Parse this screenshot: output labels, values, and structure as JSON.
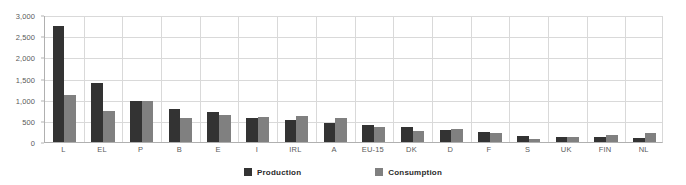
{
  "chart_data": {
    "type": "bar",
    "title": "",
    "subtitle": "",
    "xlabel": "",
    "ylabel": "",
    "ylim": [
      0,
      3000
    ],
    "ytick_values": [
      0,
      500,
      1000,
      1500,
      2000,
      2500,
      3000
    ],
    "ytick_labels": [
      "0",
      "500",
      "1,000",
      "1,500",
      "2,000",
      "2,500",
      "3,000"
    ],
    "grid": true,
    "legend_position": "bottom-center",
    "categories": [
      "L",
      "EL",
      "P",
      "B",
      "E",
      "I",
      "IRL",
      "A",
      "EU-15",
      "DK",
      "D",
      "F",
      "S",
      "UK",
      "FIN",
      "NL"
    ],
    "series": [
      {
        "name": "Production",
        "color": "#333333",
        "values": [
          2750,
          1400,
          960,
          770,
          700,
          570,
          530,
          440,
          400,
          350,
          290,
          230,
          140,
          110,
          120,
          90
        ]
      },
      {
        "name": "Consumption",
        "color": "#808080",
        "values": [
          1120,
          730,
          960,
          570,
          640,
          580,
          610,
          570,
          360,
          250,
          310,
          210,
          70,
          130,
          160,
          210
        ]
      }
    ]
  },
  "colors": {
    "production": "#333333",
    "consumption": "#808080",
    "gridline": "#d9d9d9",
    "axis": "#b0b0b0",
    "tick_text": "#5a5a5a",
    "legend_text": "#2b2b2b",
    "background": "#ffffff"
  },
  "legend": {
    "items": [
      {
        "label": "Production",
        "color": "#333333"
      },
      {
        "label": "Consumption",
        "color": "#808080"
      }
    ]
  }
}
